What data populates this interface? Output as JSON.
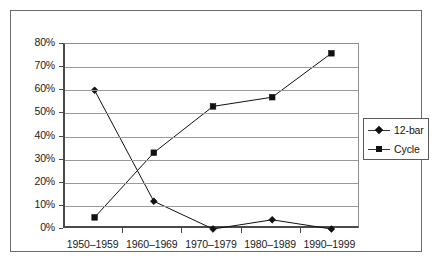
{
  "chart_data": {
    "type": "line",
    "title": "",
    "subtitle": "",
    "xlabel": "",
    "ylabel": "",
    "categories": [
      "1950–1959",
      "1960–1969",
      "1970–1979",
      "1980–1989",
      "1990–1999"
    ],
    "ylim": [
      0,
      80
    ],
    "ytick_labels": [
      "80%",
      "70%",
      "60%",
      "50%",
      "40%",
      "30%",
      "20%",
      "10%",
      "0%"
    ],
    "ytick_values": [
      80,
      70,
      60,
      50,
      40,
      30,
      20,
      10,
      0
    ],
    "grid": true,
    "legend_position": "right",
    "series": [
      {
        "name": "12-bar",
        "marker": "diamond",
        "color": "#111111",
        "values": [
          60,
          12,
          0,
          4,
          0
        ]
      },
      {
        "name": "Cycle",
        "marker": "square",
        "color": "#111111",
        "values": [
          5,
          33,
          53,
          57,
          76
        ]
      }
    ]
  },
  "legend": {
    "entries": [
      {
        "label": "12-bar",
        "marker": "diamond-marker-icon"
      },
      {
        "label": "Cycle",
        "marker": "square-marker-icon"
      }
    ]
  },
  "colors": {
    "gridline": "#9a9a9a",
    "axis": "#4a4a4a",
    "frame": "#6b6b6b",
    "series": "#111111",
    "background": "#ffffff",
    "text": "#1a1a1a"
  }
}
